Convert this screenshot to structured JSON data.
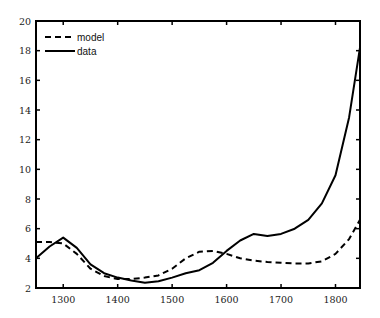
{
  "chart_data": {
    "type": "line",
    "title": "",
    "xlabel": "",
    "ylabel": "",
    "xlim": [
      1250,
      1845
    ],
    "ylim": [
      2,
      20
    ],
    "xticks": [
      1300,
      1400,
      1500,
      1600,
      1700,
      1800
    ],
    "yticks": [
      2,
      4,
      6,
      8,
      10,
      12,
      14,
      16,
      18,
      20
    ],
    "grid": false,
    "legend_position": "upper left",
    "x": [
      1250,
      1275,
      1300,
      1325,
      1350,
      1375,
      1400,
      1425,
      1450,
      1475,
      1500,
      1525,
      1550,
      1575,
      1600,
      1625,
      1650,
      1675,
      1700,
      1725,
      1750,
      1775,
      1800,
      1825,
      1845
    ],
    "series": [
      {
        "name": "model",
        "style": "dashed",
        "color": "#000000",
        "values": [
          5.1,
          5.1,
          5.0,
          4.3,
          3.3,
          2.8,
          2.6,
          2.6,
          2.7,
          2.85,
          3.3,
          4.0,
          4.45,
          4.5,
          4.3,
          4.0,
          3.85,
          3.75,
          3.7,
          3.65,
          3.65,
          3.8,
          4.3,
          5.3,
          6.6
        ]
      },
      {
        "name": "data",
        "style": "solid",
        "color": "#000000",
        "values": [
          4.0,
          4.8,
          5.4,
          4.7,
          3.6,
          3.0,
          2.7,
          2.5,
          2.35,
          2.45,
          2.7,
          3.0,
          3.2,
          3.7,
          4.5,
          5.2,
          5.65,
          5.5,
          5.65,
          6.0,
          6.6,
          7.7,
          9.6,
          13.5,
          18.2
        ]
      }
    ]
  },
  "legend": {
    "items": [
      {
        "label": "model",
        "style": "dashed"
      },
      {
        "label": "data",
        "style": "solid"
      }
    ]
  }
}
